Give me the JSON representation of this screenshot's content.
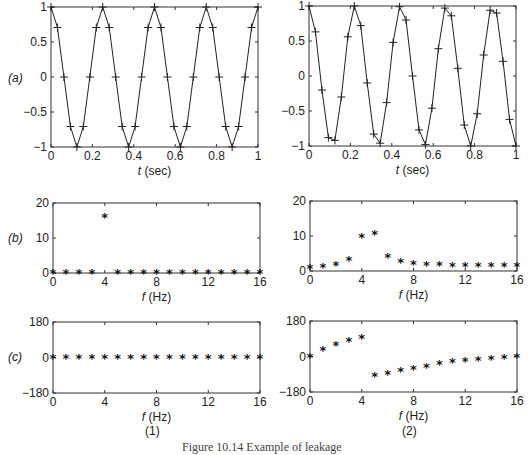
{
  "figure": {
    "caption": "Figure 10.14  Example of leakage",
    "column_labels": [
      "(1)",
      "(2)"
    ],
    "row_labels": [
      "(a)",
      "(b)",
      "(c)"
    ]
  },
  "chart_data": [
    {
      "id": "a1",
      "type": "line",
      "marker": "+",
      "title": "",
      "xlabel": "t (sec)",
      "ylabel": "",
      "xlim": [
        0,
        1
      ],
      "ylim": [
        -1,
        1
      ],
      "xticks": [
        "0",
        "0.2",
        "0.4",
        "0.6",
        "0.8",
        "1"
      ],
      "yticks": [
        "-1",
        "-0.5",
        "0",
        "0.5",
        "1"
      ],
      "x": [
        0,
        0.03125,
        0.0625,
        0.09375,
        0.125,
        0.15625,
        0.1875,
        0.21875,
        0.25,
        0.28125,
        0.3125,
        0.34375,
        0.375,
        0.40625,
        0.4375,
        0.46875,
        0.5,
        0.53125,
        0.5625,
        0.59375,
        0.625,
        0.65625,
        0.6875,
        0.71875,
        0.75,
        0.78125,
        0.8125,
        0.84375,
        0.875,
        0.90625,
        0.9375,
        0.96875,
        1
      ],
      "values": [
        1,
        0.707,
        0,
        -0.707,
        -1,
        -0.707,
        0,
        0.707,
        1,
        0.707,
        0,
        -0.707,
        -1,
        -0.707,
        0,
        0.707,
        1,
        0.707,
        0,
        -0.707,
        -1,
        -0.707,
        0,
        0.707,
        1,
        0.707,
        0,
        -0.707,
        -1,
        -0.707,
        0,
        0.707,
        1
      ]
    },
    {
      "id": "a2",
      "type": "line",
      "marker": "+",
      "title": "",
      "xlabel": "t (sec)",
      "ylabel": "",
      "xlim": [
        0,
        1
      ],
      "ylim": [
        -1,
        1
      ],
      "xticks": [
        "0",
        "0.2",
        "0.4",
        "0.6",
        "0.8",
        "1"
      ],
      "yticks": [
        "-1",
        "-0.5",
        "0",
        "0.5",
        "1"
      ],
      "x": [
        0,
        0.03125,
        0.0625,
        0.09375,
        0.125,
        0.15625,
        0.1875,
        0.21875,
        0.25,
        0.28125,
        0.3125,
        0.34375,
        0.375,
        0.40625,
        0.4375,
        0.46875,
        0.5,
        0.53125,
        0.5625,
        0.59375,
        0.625,
        0.65625,
        0.6875,
        0.71875,
        0.75,
        0.78125,
        0.8125,
        0.84375,
        0.875,
        0.90625,
        0.9375,
        0.96875,
        1
      ],
      "values": [
        1,
        0.63,
        -0.2,
        -0.88,
        -0.92,
        -0.3,
        0.56,
        1.0,
        0.72,
        -0.1,
        -0.83,
        -0.96,
        -0.38,
        0.48,
        0.99,
        0.8,
        0.0,
        -0.77,
        -0.98,
        -0.46,
        0.39,
        0.97,
        0.86,
        0.11,
        -0.7,
        -1.0,
        -0.54,
        0.3,
        0.94,
        0.9,
        0.21,
        -0.62,
        -1.0
      ]
    },
    {
      "id": "b1",
      "type": "scatter",
      "marker": "*",
      "title": "",
      "xlabel": "f (Hz)",
      "ylabel": "",
      "xlim": [
        0,
        16
      ],
      "ylim": [
        0,
        20
      ],
      "xticks": [
        "0",
        "4",
        "8",
        "12",
        "16"
      ],
      "yticks": [
        "0",
        "10",
        "20"
      ],
      "x": [
        0,
        1,
        2,
        3,
        4,
        5,
        6,
        7,
        8,
        9,
        10,
        11,
        12,
        13,
        14,
        15,
        16
      ],
      "values": [
        0,
        0,
        0,
        0,
        16,
        0,
        0,
        0,
        0,
        0,
        0,
        0,
        0,
        0,
        0,
        0,
        0
      ]
    },
    {
      "id": "b2",
      "type": "scatter",
      "marker": "*",
      "title": "",
      "xlabel": "f (Hz)",
      "ylabel": "",
      "xlim": [
        0,
        16
      ],
      "ylim": [
        0,
        20
      ],
      "xticks": [
        "0",
        "4",
        "8",
        "12",
        "16"
      ],
      "yticks": [
        "0",
        "10",
        "20"
      ],
      "x": [
        0,
        1,
        2,
        3,
        4,
        5,
        6,
        7,
        8,
        9,
        10,
        11,
        12,
        13,
        14,
        15,
        16
      ],
      "values": [
        0.8,
        1.2,
        1.8,
        3.1,
        9.7,
        10.6,
        3.9,
        2.7,
        2.1,
        1.8,
        1.6,
        1.5,
        1.4,
        1.4,
        1.4,
        1.4,
        1.4
      ]
    },
    {
      "id": "c1",
      "type": "scatter",
      "marker": "*",
      "title": "",
      "xlabel": "f (Hz)",
      "ylabel": "",
      "xlim": [
        0,
        16
      ],
      "ylim": [
        -180,
        180
      ],
      "xticks": [
        "0",
        "4",
        "8",
        "12",
        "16"
      ],
      "yticks": [
        "-180",
        "0",
        "180"
      ],
      "x": [
        0,
        1,
        2,
        3,
        4,
        5,
        6,
        7,
        8,
        9,
        10,
        11,
        12,
        13,
        14,
        15,
        16
      ],
      "values": [
        0,
        0,
        0,
        0,
        0,
        0,
        0,
        0,
        0,
        0,
        0,
        0,
        0,
        0,
        0,
        0,
        0
      ]
    },
    {
      "id": "c2",
      "type": "scatter",
      "marker": "*",
      "title": "",
      "xlabel": "f (Hz)",
      "ylabel": "",
      "xlim": [
        0,
        16
      ],
      "ylim": [
        -180,
        180
      ],
      "xticks": [
        "0",
        "4",
        "8",
        "12",
        "16"
      ],
      "yticks": [
        "-180",
        "0",
        "180"
      ],
      "x": [
        0,
        1,
        2,
        3,
        4,
        5,
        6,
        7,
        8,
        9,
        10,
        11,
        12,
        13,
        14,
        15,
        16
      ],
      "values": [
        0,
        34,
        56,
        79,
        96,
        -101,
        -90,
        -73,
        -62,
        -51,
        -39,
        -29,
        -23,
        -17,
        -11,
        -6,
        0
      ]
    }
  ]
}
